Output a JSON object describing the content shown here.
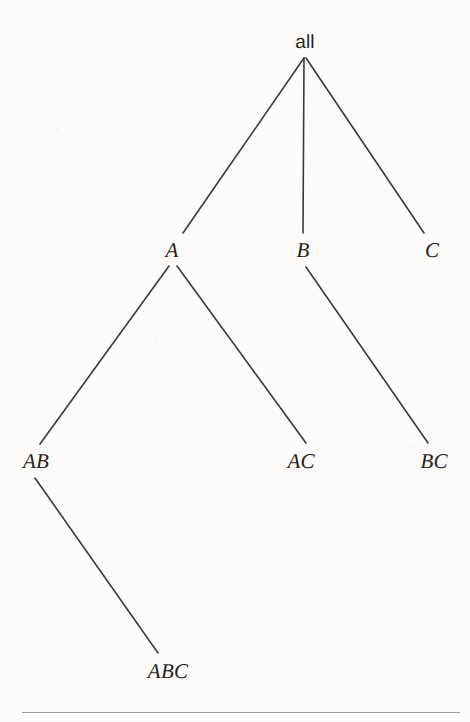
{
  "figure": {
    "type": "tree-diagram",
    "title": "",
    "background_color": "#fdfcfb",
    "line_color": "#3a3a3a",
    "text_color": "#232323",
    "width": 470,
    "height": 722
  },
  "nodes": [
    {
      "id": "all",
      "label": "all",
      "x": 305,
      "y": 42,
      "style": "roman",
      "level": 0
    },
    {
      "id": "A",
      "label": "A",
      "x": 172,
      "y": 250,
      "style": "italic",
      "level": 1
    },
    {
      "id": "B",
      "label": "B",
      "x": 303,
      "y": 250,
      "style": "italic",
      "level": 1
    },
    {
      "id": "C",
      "label": "C",
      "x": 432,
      "y": 250,
      "style": "italic",
      "level": 1
    },
    {
      "id": "AB",
      "label": "AB",
      "x": 36,
      "y": 461,
      "style": "italic",
      "level": 2
    },
    {
      "id": "AC",
      "label": "AC",
      "x": 301,
      "y": 461,
      "style": "italic",
      "level": 2
    },
    {
      "id": "BC",
      "label": "BC",
      "x": 434,
      "y": 461,
      "style": "italic",
      "level": 2
    },
    {
      "id": "ABC",
      "label": "ABC",
      "x": 168,
      "y": 671,
      "style": "italic",
      "level": 3
    }
  ],
  "edges": [
    {
      "from": "all",
      "to": "A",
      "x1": 304,
      "y1": 58,
      "x2": 183,
      "y2": 233
    },
    {
      "from": "all",
      "to": "B",
      "x1": 304,
      "y1": 58,
      "x2": 303,
      "y2": 233
    },
    {
      "from": "all",
      "to": "C",
      "x1": 306,
      "y1": 58,
      "x2": 424,
      "y2": 233
    },
    {
      "from": "A",
      "to": "AB",
      "x1": 169,
      "y1": 266,
      "x2": 40,
      "y2": 444
    },
    {
      "from": "A",
      "to": "AC",
      "x1": 177,
      "y1": 266,
      "x2": 306,
      "y2": 443
    },
    {
      "from": "B",
      "to": "BC",
      "x1": 306,
      "y1": 267,
      "x2": 428,
      "y2": 443
    },
    {
      "from": "AB",
      "to": "ABC",
      "x1": 35,
      "y1": 478,
      "x2": 158,
      "y2": 653
    }
  ],
  "footer_rule": {
    "name": "horizontal-rule",
    "x": 22,
    "y": 712,
    "width": 438,
    "color": "#9b9b9b"
  }
}
